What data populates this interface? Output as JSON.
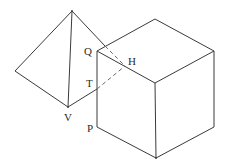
{
  "diagram": {
    "title": "",
    "labels": {
      "Q": "Q",
      "H": "H",
      "T": "T",
      "V": "V",
      "P": "P"
    },
    "shapes": [
      "pyramid",
      "cube"
    ],
    "colors": {
      "stroke": "#3a3a3a",
      "hidden_stroke": "#6a6a6a",
      "background": "#ffffff"
    }
  }
}
